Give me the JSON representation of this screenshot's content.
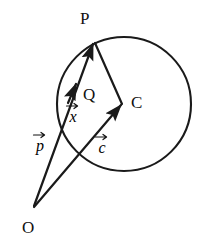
{
  "figure": {
    "background_color": "#ffffff",
    "stroke_color": "#1a1a1a",
    "text_color": "#111111",
    "width": 209,
    "height": 242
  },
  "points": {
    "P": {
      "label": "P",
      "x": 94,
      "y": 41,
      "label_x": 80,
      "label_y": 10
    },
    "C": {
      "label": "C",
      "x": 123,
      "y": 104,
      "label_x": 131,
      "label_y": 94
    },
    "Q": {
      "label": "Q",
      "x": 89,
      "y": 108,
      "label_x": 83,
      "label_y": 86
    },
    "O": {
      "label": "O",
      "x": 33,
      "y": 208,
      "label_x": 22,
      "label_y": 219
    }
  },
  "circle": {
    "name": "circle",
    "center_x": 124,
    "center_y": 104,
    "radius": 67
  },
  "vectors": [
    {
      "name": "vector-p",
      "glyph": "p",
      "accent": "right-arrow",
      "from": "O",
      "to": "P",
      "label_x": 33,
      "label_y": 131
    },
    {
      "name": "vector-c",
      "glyph": "c",
      "accent": "right-arrow",
      "from": "O",
      "to": "C",
      "label_x": 95,
      "label_y": 133
    },
    {
      "name": "vector-x",
      "glyph": "x",
      "accent": "right-arrow",
      "from": "C",
      "to": "P",
      "label_x": 66,
      "label_y": 102
    }
  ],
  "segments": [
    {
      "name": "segment-P-C",
      "from": "P",
      "to": "C"
    }
  ]
}
